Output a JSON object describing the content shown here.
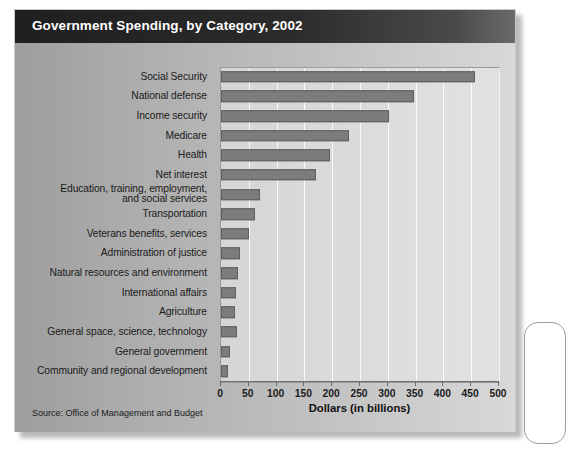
{
  "figure": {
    "title": "Government Spending, by Category, 2002",
    "source": "Source: Office of Management and Budget"
  },
  "chart_data": {
    "type": "bar",
    "orientation": "horizontal",
    "title": "Government Spending, by Category, 2002",
    "xlabel": "Dollars (in billions)",
    "ylabel": "",
    "xlim": [
      0,
      500
    ],
    "xticks": [
      0,
      50,
      100,
      150,
      200,
      250,
      300,
      350,
      400,
      450,
      500
    ],
    "xtick_labels": [
      "0",
      "50",
      "100",
      "150",
      "200",
      "250",
      "300",
      "350",
      "400",
      "450",
      "500"
    ],
    "grid": "vertical",
    "legend": "none",
    "bar_color": "#7c7c7c",
    "bar_edge_color": "#5e5e5e",
    "categories": [
      "Social Security",
      "National defense",
      "Income security",
      "Medicare",
      "Health",
      "Net interest",
      "Education, training, employment,\nand social services",
      "Transportation",
      "Veterans benefits, services",
      "Administration of justice",
      "Natural resources and environment",
      "International affairs",
      "Agriculture",
      "General space,  science, technology",
      "General government",
      "Community and regional development"
    ],
    "values": [
      456,
      348,
      303,
      230,
      196,
      171,
      70,
      62,
      51,
      35,
      30,
      27,
      25,
      28,
      16,
      13
    ],
    "source": "Source: Office of Management and Budget"
  },
  "axis_title": "Dollars (in billions)"
}
